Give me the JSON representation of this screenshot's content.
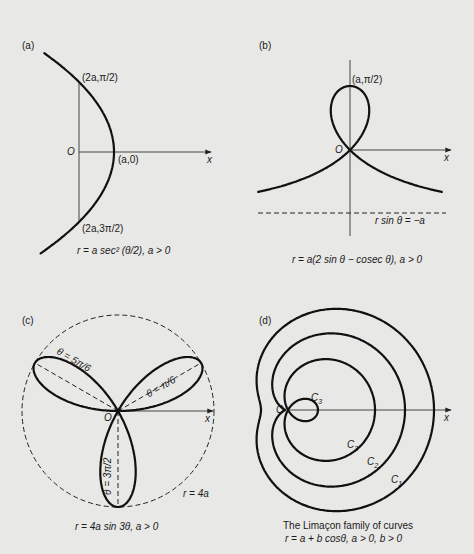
{
  "figure": {
    "background": "#e8e8e6",
    "ink": "#111111",
    "panels": [
      {
        "id": "a",
        "tag": "(a)",
        "caption": "r = a sec² (θ/2), a > 0",
        "labels": {
          "top_point": "(2a,π/2)",
          "vertex": "(a,0)",
          "bottom_point": "(2a,3π/2)",
          "origin": "O",
          "x_axis": "x"
        }
      },
      {
        "id": "b",
        "tag": "(b)",
        "caption": "r = a(2 sin θ − cosec θ), a > 0",
        "labels": {
          "top_point": "(a,π/2)",
          "origin": "O",
          "x_axis": "x",
          "asymptote": "r sin θ = −a"
        }
      },
      {
        "id": "c",
        "tag": "(c)",
        "caption": "r = 4a sin 3θ, a > 0",
        "labels": {
          "petal_right": "θ = π/6",
          "petal_left": "θ = 5π/6",
          "petal_down": "θ = 3π/2",
          "origin": "O",
          "x_axis": "x",
          "circle": "r = 4a"
        }
      },
      {
        "id": "d",
        "tag": "(d)",
        "caption_line1": "The Limaçon family of curves",
        "caption_line2": "r = a + b cosθ, a > 0, b > 0",
        "labels": {
          "origin": "O",
          "x_axis": "x",
          "c1": "C",
          "c1_sub": "1",
          "c2": "C",
          "c2_sub": "2",
          "c3": "C",
          "c3_sub": "3",
          "c3_loop": "C",
          "c3_loop_sub": "3"
        }
      }
    ]
  },
  "chart_data": [
    {
      "type": "polar-curve",
      "panel": "a",
      "equation": "r = a sec^2(theta/2)",
      "params": {
        "a": 35
      },
      "origin_px": [
        79,
        152
      ],
      "theta_range_deg": [
        -142,
        142
      ],
      "annotated_points": [
        {
          "label": "(2a,π/2)",
          "r": "2a",
          "theta": "π/2"
        },
        {
          "label": "(a,0)",
          "r": "a",
          "theta": "0"
        },
        {
          "label": "(2a,3π/2)",
          "r": "2a",
          "theta": "3π/2"
        }
      ],
      "axes": {
        "x_axis_end_px": 210,
        "vertical_chord": true
      }
    },
    {
      "type": "polar-curve",
      "panel": "b",
      "equation": "r = a(2 sin theta - cosec theta)",
      "params": {
        "a": 64
      },
      "origin_px": [
        350,
        150
      ],
      "asymptote": "r sin theta = -a",
      "annotated_points": [
        {
          "label": "(a,π/2)",
          "r": "a",
          "theta": "π/2"
        }
      ],
      "axes": {
        "x_axis_end_px": 450,
        "y_axis_px": [
          60,
          236
        ]
      }
    },
    {
      "type": "polar-curve",
      "panel": "c",
      "equation": "r = 4a sin 3theta",
      "params": {
        "a": 24
      },
      "origin_px": [
        118,
        411
      ],
      "bounding_circle": "r = 4a",
      "petal_axes": [
        "θ = π/6",
        "θ = 5π/6",
        "θ = 3π/2"
      ],
      "axes": {
        "x_axis_end_px": 213
      }
    },
    {
      "type": "polar-curve-family",
      "panel": "d",
      "equation": "r = a + b cos theta",
      "origin_px": [
        288,
        410
      ],
      "series": [
        {
          "name": "C1",
          "a": 86.5,
          "b": 59.5,
          "note": "a > b (dimpled)"
        },
        {
          "name": "C2",
          "a": 60,
          "b": 57,
          "note": "a ≈ b (near cardioid)"
        },
        {
          "name": "C3",
          "a": 28.5,
          "b": 58.5,
          "note": "a < b (inner loop)"
        }
      ],
      "axes": {
        "x_axis_end_px": 450
      }
    }
  ]
}
